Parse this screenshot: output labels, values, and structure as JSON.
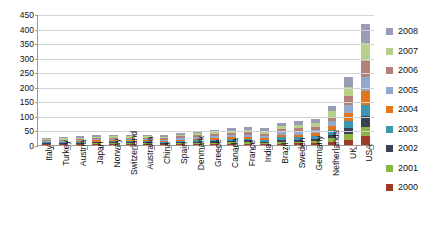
{
  "chart_data": {
    "type": "bar",
    "subtype": "stacked-column",
    "title": "",
    "xlabel": "",
    "ylabel": "",
    "ylim": [
      0,
      450
    ],
    "ytick_step": 50,
    "yticks": [
      "450",
      "400",
      "350",
      "300",
      "250",
      "200",
      "150",
      "100",
      "50",
      "0"
    ],
    "grid": true,
    "legend_position": "right",
    "categories": [
      "Italy",
      "Turkey",
      "Austria",
      "Japan",
      "Norway",
      "Switzerland",
      "Australia",
      "China",
      "Spain",
      "Denmark",
      "Greece",
      "Canada",
      "France",
      "India",
      "Brazil",
      "Sweden",
      "Germany",
      "Netherlands",
      "UK",
      "USA"
    ],
    "series": [
      {
        "name": "2000",
        "color": "#9E3A26",
        "values": [
          2,
          2,
          2,
          3,
          3,
          3,
          3,
          2,
          3,
          4,
          4,
          5,
          5,
          3,
          5,
          6,
          6,
          11,
          18,
          30
        ]
      },
      {
        "name": "2001",
        "color": "#8EB544",
        "values": [
          2,
          2,
          3,
          3,
          3,
          3,
          3,
          2,
          3,
          4,
          4,
          5,
          5,
          4,
          6,
          6,
          7,
          12,
          20,
          33
        ]
      },
      {
        "name": "2002",
        "color": "#3C4255",
        "values": [
          2,
          2,
          3,
          3,
          3,
          3,
          3,
          3,
          4,
          4,
          5,
          5,
          6,
          5,
          7,
          7,
          8,
          13,
          22,
          36
        ]
      },
      {
        "name": "2003",
        "color": "#3D96AF",
        "values": [
          3,
          3,
          3,
          3,
          4,
          4,
          4,
          3,
          4,
          5,
          5,
          6,
          6,
          5,
          8,
          8,
          9,
          14,
          24,
          40
        ]
      },
      {
        "name": "2004",
        "color": "#E3761C",
        "values": [
          3,
          3,
          3,
          4,
          4,
          4,
          4,
          4,
          5,
          5,
          6,
          6,
          7,
          6,
          9,
          9,
          10,
          15,
          26,
          45
        ]
      },
      {
        "name": "2005",
        "color": "#92A8CE",
        "values": [
          3,
          3,
          4,
          4,
          4,
          4,
          4,
          4,
          5,
          6,
          6,
          7,
          7,
          7,
          9,
          10,
          11,
          16,
          28,
          50
        ]
      },
      {
        "name": "2006",
        "color": "#B2817C",
        "values": [
          3,
          4,
          4,
          4,
          4,
          5,
          5,
          5,
          6,
          6,
          7,
          7,
          8,
          9,
          10,
          11,
          12,
          17,
          30,
          56
        ]
      },
      {
        "name": "2007",
        "color": "#B5D08B",
        "values": [
          4,
          4,
          4,
          4,
          5,
          5,
          5,
          5,
          6,
          7,
          7,
          8,
          9,
          10,
          11,
          12,
          13,
          18,
          32,
          60
        ]
      },
      {
        "name": "2008",
        "color": "#9A9BB5",
        "values": [
          4,
          4,
          4,
          5,
          5,
          5,
          5,
          5,
          6,
          7,
          8,
          8,
          9,
          11,
          12,
          13,
          14,
          19,
          35,
          65
        ]
      }
    ]
  },
  "legend": {
    "items": [
      {
        "label": "2008",
        "color": "#9A9BB5"
      },
      {
        "label": "2007",
        "color": "#B5D08B"
      },
      {
        "label": "2006",
        "color": "#B2817C"
      },
      {
        "label": "2005",
        "color": "#92A8CE"
      },
      {
        "label": "2004",
        "color": "#E3761C"
      },
      {
        "label": "2003",
        "color": "#3D96AF"
      },
      {
        "label": "2002",
        "color": "#3C4255"
      },
      {
        "label": "2001",
        "color": "#8EB544"
      },
      {
        "label": "2000",
        "color": "#9E3A26"
      }
    ]
  },
  "colors": {
    "gridline": "#d3d3d3",
    "axis": "#9b9b9b",
    "background": "#ffffff",
    "text": "#111111"
  }
}
